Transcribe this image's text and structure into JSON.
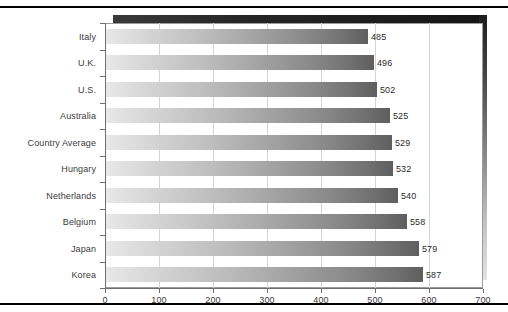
{
  "chart_data": {
    "type": "bar",
    "orientation": "horizontal",
    "title": "",
    "subtitle": "",
    "xlabel": "",
    "ylabel": "",
    "categories": [
      "Italy",
      "U.K.",
      "U.S.",
      "Australia",
      "Country Average",
      "Hungary",
      "Netherlands",
      "Belgium",
      "Japan",
      "Korea"
    ],
    "values": [
      485,
      496,
      502,
      525,
      529,
      532,
      540,
      558,
      579,
      587
    ],
    "value_labels": [
      "485",
      "496",
      "502",
      "525",
      "529",
      "532",
      "540",
      "558",
      "579",
      "587"
    ],
    "xlim": [
      0,
      700
    ],
    "xticks": [
      0,
      100,
      200,
      300,
      400,
      500,
      600,
      700
    ],
    "xtick_labels": [
      "0",
      "100",
      "200",
      "300",
      "400",
      "500",
      "600",
      "700"
    ],
    "grid": "vertical",
    "legend": "none",
    "bar_fill": "gradient-light-to-dark-gray",
    "colors": {
      "bar_start": "#e8e8e8",
      "bar_end": "#5e5e5e",
      "gridline": "#d4d4d4",
      "axis": "#6e6e6e",
      "frame_shadow": "#1b1b1b",
      "text": "#3b3b3b",
      "background": "#ffffff"
    }
  }
}
